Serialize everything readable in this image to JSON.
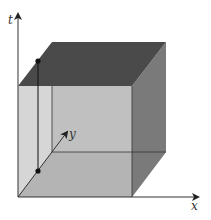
{
  "diagram": {
    "type": "3d-cube-spacetime",
    "axes": {
      "t": {
        "label": "t"
      },
      "x": {
        "label": "x"
      },
      "y": {
        "label": "y"
      }
    },
    "faces": {
      "top": {
        "color": "#4a4a4a"
      },
      "right": {
        "color": "#7a7a7a"
      },
      "front_left_strip": {
        "color": "#d6d6d6"
      },
      "front_main": {
        "color": "#c2c2c2"
      },
      "bottom": {
        "color": "#b2b2b2"
      }
    },
    "points": [
      {
        "name": "top-point",
        "x": 38,
        "y": 61
      },
      {
        "name": "bottom-point",
        "x": 38,
        "y": 171
      }
    ],
    "colors": {
      "line": "#222222",
      "axis": "#333333"
    }
  }
}
